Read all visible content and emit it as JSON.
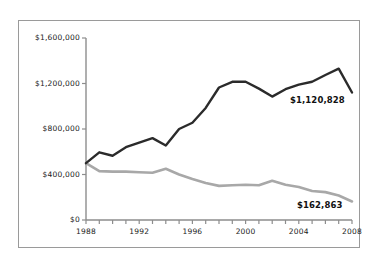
{
  "chart_data": {
    "type": "line",
    "title": "",
    "subtitle": "",
    "xlabel": "",
    "ylabel": "",
    "xlim": [
      1988,
      2008
    ],
    "ylim": [
      0,
      1600000
    ],
    "grid": false,
    "legend_position": "none",
    "x": [
      1988,
      1989,
      1990,
      1991,
      1992,
      1993,
      1994,
      1995,
      1996,
      1997,
      1998,
      1999,
      2000,
      2001,
      2002,
      2003,
      2004,
      2005,
      2006,
      2007,
      2008
    ],
    "xticks": [
      1988,
      1989,
      1990,
      1991,
      1992,
      1993,
      1994,
      1995,
      1996,
      1997,
      1998,
      1999,
      2000,
      2001,
      2002,
      2003,
      2004,
      2005,
      2006,
      2007,
      2008
    ],
    "xtick_labels": [
      "1988",
      "",
      "",
      "",
      "1992",
      "",
      "",
      "",
      "1996",
      "",
      "",
      "",
      "2000",
      "",
      "",
      "",
      "2004",
      "",
      "",
      "",
      "2008"
    ],
    "yticks": [
      0,
      400000,
      800000,
      1200000,
      1600000
    ],
    "ytick_labels": [
      "$0",
      "$400,000",
      "$800,000",
      "$1,200,000",
      "$1,600,000"
    ],
    "series": [
      {
        "name": "upper-series",
        "color": "#2b2b2b",
        "end_label": "$1,120,828",
        "values": [
          500000,
          595000,
          565000,
          640000,
          680000,
          720000,
          655000,
          800000,
          855000,
          985000,
          1165000,
          1215000,
          1215000,
          1155000,
          1085000,
          1150000,
          1190000,
          1215000,
          1275000,
          1330000,
          1120828
        ]
      },
      {
        "name": "lower-series",
        "color": "#a8a8a8",
        "end_label": "$162,863",
        "values": [
          500000,
          430000,
          425000,
          425000,
          420000,
          415000,
          450000,
          400000,
          360000,
          325000,
          300000,
          305000,
          310000,
          305000,
          345000,
          310000,
          290000,
          255000,
          245000,
          215000,
          162863
        ]
      }
    ]
  },
  "labels": {
    "upper_value": "$1,120,828",
    "lower_value": "$162,863"
  }
}
